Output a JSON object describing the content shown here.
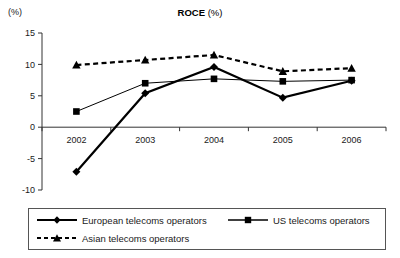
{
  "chart_data": {
    "type": "line",
    "title": "ROCE (%)",
    "title_main": "ROCE",
    "title_unit": "(%)",
    "unit_label": "(%)",
    "xlabel": "",
    "ylabel": "",
    "categories": [
      "2002",
      "2003",
      "2004",
      "2005",
      "2006"
    ],
    "ylim": [
      -10,
      15
    ],
    "yticks": [
      15,
      10,
      5,
      0,
      -5,
      -10
    ],
    "ytick_labels": [
      "15",
      "10",
      "5",
      "0",
      "-5",
      "-10"
    ],
    "grid": false,
    "legend_position": "below",
    "series": [
      {
        "name": "European telecoms operators",
        "marker": "diamond",
        "line_style": "solid",
        "line_width": 2.2,
        "color": "#000000",
        "values": [
          -7.1,
          5.4,
          9.6,
          4.7,
          7.4
        ]
      },
      {
        "name": "US telecoms operators",
        "marker": "square",
        "line_style": "solid",
        "line_width": 1,
        "color": "#000000",
        "values": [
          2.5,
          7.0,
          7.7,
          7.3,
          7.5
        ]
      },
      {
        "name": "Asian telecoms operators",
        "marker": "triangle",
        "line_style": "dashed",
        "line_width": 2.2,
        "color": "#000000",
        "values": [
          9.9,
          10.7,
          11.5,
          8.9,
          9.4
        ]
      }
    ]
  },
  "legend": {
    "items": [
      {
        "label": "European telecoms operators"
      },
      {
        "label": "US telecoms operators"
      },
      {
        "label": "Asian telecoms operators"
      }
    ]
  }
}
